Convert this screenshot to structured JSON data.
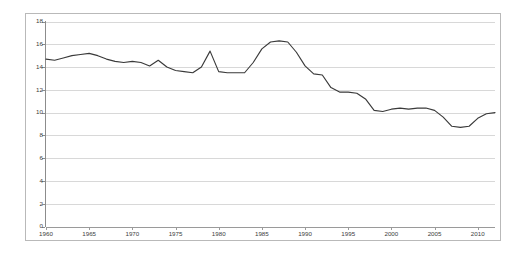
{
  "chart_data": {
    "type": "line",
    "title": "",
    "subtitle": "",
    "xlabel": "",
    "ylabel": "",
    "xlim": [
      1960,
      2012
    ],
    "ylim": [
      0,
      18
    ],
    "grid": true,
    "legend": "none",
    "y_ticks": [
      0,
      2,
      4,
      6,
      8,
      10,
      12,
      14,
      16,
      18
    ],
    "y_tick_labels": [
      "0",
      "2",
      "4",
      "6",
      "8",
      "10",
      "12",
      "14",
      "16",
      "18"
    ],
    "x_ticks": [
      1960,
      1965,
      1970,
      1975,
      1980,
      1985,
      1990,
      1995,
      2000,
      2005,
      2010
    ],
    "x_tick_labels": [
      "1960",
      "1965",
      "1970",
      "1975",
      "1980",
      "1985",
      "1990",
      "1995",
      "2000",
      "2005",
      "2010"
    ],
    "line_color": "#3a3a3a",
    "grid_color": "#d8d8d8",
    "axis_color": "#8c8c8c",
    "x": [
      1960,
      1961,
      1962,
      1963,
      1964,
      1965,
      1966,
      1967,
      1968,
      1969,
      1970,
      1971,
      1972,
      1973,
      1974,
      1975,
      1976,
      1977,
      1978,
      1979,
      1980,
      1981,
      1982,
      1983,
      1984,
      1985,
      1986,
      1987,
      1988,
      1989,
      1990,
      1991,
      1992,
      1993,
      1994,
      1995,
      1996,
      1997,
      1998,
      1999,
      2000,
      2001,
      2002,
      2003,
      2004,
      2005,
      2006,
      2007,
      2008,
      2009,
      2010,
      2011,
      2012
    ],
    "values": [
      14.7,
      14.6,
      14.8,
      15.0,
      15.1,
      15.2,
      15.0,
      14.7,
      14.5,
      14.4,
      14.5,
      14.4,
      14.1,
      14.6,
      14.0,
      13.7,
      13.6,
      13.5,
      14.0,
      15.4,
      13.6,
      13.5,
      13.5,
      13.5,
      14.4,
      15.6,
      16.2,
      16.3,
      16.2,
      15.3,
      14.1,
      13.4,
      13.3,
      12.2,
      11.8,
      11.8,
      11.7,
      11.2,
      10.2,
      10.1,
      10.3,
      10.4,
      10.3,
      10.4,
      10.4,
      10.2,
      9.6,
      8.8,
      8.7,
      8.8,
      9.5,
      9.9,
      10.0
    ],
    "series_name": "value"
  },
  "axes": {
    "y_axis_name": "y-axis",
    "x_axis_name": "x-axis"
  }
}
